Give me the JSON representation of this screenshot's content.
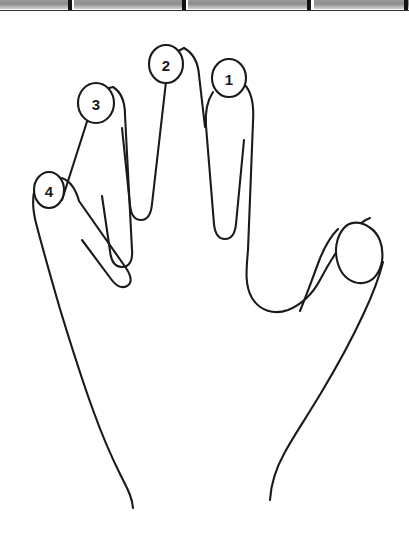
{
  "page": {
    "background_color": "#ffffff",
    "ink_color": "#1a1a1a",
    "width": 409,
    "height": 538
  },
  "scan_strip": {
    "name": "scanned-table-row-fragment",
    "background_color": "#8d8d8d",
    "rule_color": "#2e2e2e",
    "tick_color": "#121212",
    "cells": [
      {
        "left": 0,
        "width": 70
      },
      {
        "left": 74,
        "width": 110
      },
      {
        "left": 188,
        "width": 122
      },
      {
        "left": 314,
        "width": 95
      }
    ],
    "ticks": [
      {
        "left": 68
      },
      {
        "left": 182
      },
      {
        "left": 307
      },
      {
        "left": 404
      }
    ],
    "rule_top": 10
  },
  "figure": {
    "name": "hand-outline-diagram",
    "hand_outline_path": "M 243 83 C 252 91 253 104 252 120 L 247 252 C 245 276 244 288 251 300 C 258 312 272 316 285 312 C 300 307 311 296 318 283 C 327 266 336 248 348 232 C 356 221 362 215 369 215 M 372 258 C 369 274 363 292 355 311 C 344 338 330 366 315 392 C 300 418 288 437 280 452 C 272 466 267 480 266 498 M 186 65 C 192 73 193 85 192 100 L 181 230 C 180 240 176 244 170 244 C 164 244 160 240 159 230 L 148 110 C 147 98 148 89 153 82 M 116 105 C 122 113 123 125 121 139 L 105 275 C 104 285 100 289 94 289 C 88 289 85 285 84 275 L 76 144 C 75 132 78 122 84 114 M 68 192 C 74 200 76 212 75 225 L 110 279 C 115 287 114 292 109 294 C 104 296 100 294 95 287 L 36 218 C 30 209 29 199 33 190 M 33 196 C 33 214 34 239 37 268 C 41 308 47 344 55 378 C 63 412 73 440 84 461 C 93 479 99 493 100 508",
    "thumb_nail": {
      "name": "thumb-nail",
      "numbered": false,
      "path": "M 341 226 C 334 235 333 249 337 262 C 341 275 351 283 362 282 C 372 281 379 272 381 260 C 383 246 379 232 370 226 C 360 220 348 219 341 226 Z"
    },
    "nails": [
      {
        "id": "nail-1",
        "label": "1",
        "finger": "index",
        "cx": 229,
        "cy": 78,
        "rx": 17,
        "ry": 19
      },
      {
        "id": "nail-2",
        "label": "2",
        "finger": "middle",
        "cx": 166,
        "cy": 64,
        "rx": 17,
        "ry": 19
      },
      {
        "id": "nail-3",
        "label": "3",
        "finger": "ring",
        "cx": 96,
        "cy": 103,
        "rx": 18,
        "ry": 20
      },
      {
        "id": "nail-4",
        "label": "4",
        "finger": "little",
        "cx": 49,
        "cy": 190,
        "rx": 15,
        "ry": 18
      }
    ]
  }
}
